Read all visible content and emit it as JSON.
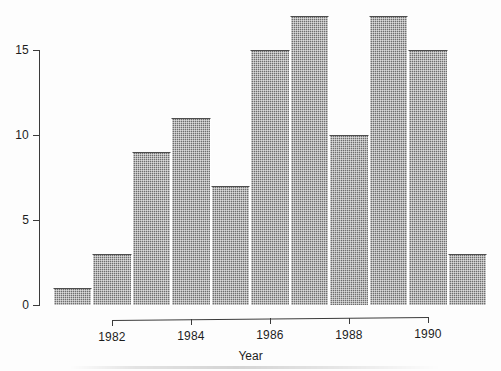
{
  "chart_data": {
    "type": "bar",
    "title": "",
    "xlabel": "Year",
    "ylabel": "",
    "xlim": [
      1980.5,
      1991.5
    ],
    "ylim": [
      0,
      17.6
    ],
    "grid": false,
    "legend": null,
    "bin_width": 1,
    "bin_starts": [
      1980.5,
      1981.5,
      1982.5,
      1983.5,
      1984.5,
      1985.5,
      1986.5,
      1987.5,
      1988.5,
      1989.5,
      1990.5
    ],
    "categories": [
      "1980.5-1981.5",
      "1981.5-1982.5",
      "1982.5-1983.5",
      "1983.5-1984.5",
      "1984.5-1985.5",
      "1985.5-1986.5",
      "1986.5-1987.5",
      "1987.5-1988.5",
      "1988.5-1989.5",
      "1989.5-1990.5",
      "1990.5-1991.5"
    ],
    "values": [
      1,
      3,
      9,
      11,
      7,
      15,
      17,
      10,
      17,
      15,
      3
    ],
    "x_ticks": [
      1982,
      1984,
      1986,
      1988,
      1990
    ],
    "x_tick_labels": [
      "1982",
      "1984",
      "1986",
      "1988",
      "1990"
    ],
    "y_ticks": [
      0,
      5,
      10,
      15
    ],
    "y_tick_labels": [
      "0",
      "5",
      "10",
      "15"
    ],
    "bar_color": "#6e6e6e",
    "bar_edge_color": "#ffffff",
    "axis_color": "#3b3b3b",
    "background_color": "#fdfdfd"
  }
}
